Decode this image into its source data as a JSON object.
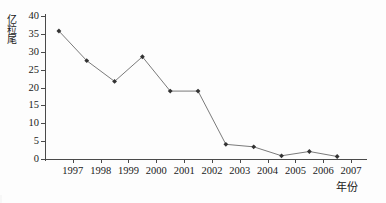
{
  "chart_data": {
    "type": "line",
    "title": "",
    "xlabel": "年份",
    "ylabel": "亿粒尾",
    "x": [
      1996.5,
      1997.5,
      1998.5,
      1999.5,
      2000.5,
      2001.5,
      2002.5,
      2003.5,
      2004.5,
      2005.5,
      2006.5
    ],
    "values": [
      35.8,
      27.5,
      21.7,
      28.6,
      19.0,
      19.0,
      4.1,
      3.4,
      0.9,
      2.1,
      0.7
    ],
    "series": [
      {
        "name": "",
        "values": [
          35.8,
          27.5,
          21.7,
          28.6,
          19.0,
          19.0,
          4.1,
          3.4,
          0.9,
          2.1,
          0.7
        ]
      }
    ],
    "xtick_labels": [
      "1997",
      "1998",
      "1999",
      "2000",
      "2001",
      "2002",
      "2003",
      "2004",
      "2005",
      "2006",
      "2007"
    ],
    "xtick_values": [
      1997,
      1998,
      1999,
      2000,
      2001,
      2002,
      2003,
      2004,
      2005,
      2006,
      2007
    ],
    "ytick_labels": [
      "0",
      "5",
      "10",
      "15",
      "20",
      "25",
      "30",
      "35",
      "40"
    ],
    "ytick_values": [
      0,
      5,
      10,
      15,
      20,
      25,
      30,
      35,
      40
    ],
    "xlim": [
      1996,
      2007.5
    ],
    "ylim": [
      0,
      40
    ],
    "grid": false,
    "legend": false,
    "legend_position": "none",
    "line_color": "#6b6b6b",
    "marker_color": "#333333",
    "marker": "diamond",
    "axis_color": "#4a4a4a",
    "background": "#fdfdfd"
  }
}
